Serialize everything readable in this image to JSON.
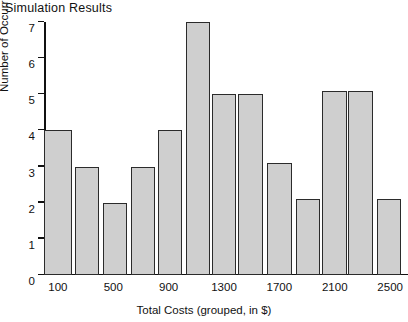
{
  "chart_data": {
    "type": "bar",
    "title": "Simulation Results",
    "xlabel": "Total Costs (grouped, in $)",
    "ylabel": "Number of Occurrences",
    "grid": false,
    "legend": null,
    "ylim": [
      0,
      7
    ],
    "y_ticks": [
      0,
      1,
      2,
      3,
      4,
      5,
      6,
      7
    ],
    "y_tick_labels": [
      "0",
      "1",
      "2",
      "3",
      "4",
      "5",
      "6",
      "7"
    ],
    "xlim": [
      0,
      2600
    ],
    "x_tick_labels": [
      "100",
      "500",
      "900",
      "1300",
      "1700",
      "2100",
      "2500"
    ],
    "x_tick_values": [
      100,
      500,
      900,
      1300,
      1700,
      2100,
      2500
    ],
    "bin_width": 200,
    "bin_starts": [
      0,
      200,
      400,
      600,
      800,
      1000,
      1200,
      1400,
      1600,
      1800,
      2000,
      2200,
      2400
    ],
    "categories": [
      "0-200",
      "200-400",
      "400-600",
      "600-800",
      "800-1000",
      "1000-1200",
      "1200-1400",
      "1400-1600",
      "1600-1800",
      "1800-2000",
      "2000-2200",
      "2200-2400",
      "2400-2600"
    ],
    "values": [
      4,
      3,
      2,
      3,
      4,
      7,
      5,
      5,
      3.1,
      2.1,
      5.1,
      5.1,
      2.1
    ],
    "bars": [
      {
        "label": "0-200",
        "x0": 0,
        "x1": 200,
        "value": 4
      },
      {
        "label": "200-400",
        "x0": 225,
        "x1": 400,
        "value": 3
      },
      {
        "label": "400-600",
        "x0": 425,
        "x1": 600,
        "value": 2
      },
      {
        "label": "600-800",
        "x0": 625,
        "x1": 800,
        "value": 3
      },
      {
        "label": "800-1000",
        "x0": 825,
        "x1": 1000,
        "value": 4
      },
      {
        "label": "1000-1200",
        "x0": 1025,
        "x1": 1200,
        "value": 7
      },
      {
        "label": "1200-1400",
        "x0": 1210,
        "x1": 1390,
        "value": 5
      },
      {
        "label": "1400-1600",
        "x0": 1400,
        "x1": 1580,
        "value": 5
      },
      {
        "label": "1600-1800",
        "x0": 1610,
        "x1": 1790,
        "value": 3.1
      },
      {
        "label": "1800-2000",
        "x0": 1820,
        "x1": 1990,
        "value": 2.1
      },
      {
        "label": "2000-2200",
        "x0": 2005,
        "x1": 2185,
        "value": 5.1
      },
      {
        "label": "2200-2400",
        "x0": 2195,
        "x1": 2375,
        "value": 5.1
      },
      {
        "label": "2400-2600",
        "x0": 2405,
        "x1": 2580,
        "value": 2.1
      }
    ],
    "minor_x_ticks": [
      100,
      300,
      500,
      700,
      900,
      1100,
      1300,
      1500,
      1700,
      1900,
      2100,
      2300,
      2500
    ]
  }
}
